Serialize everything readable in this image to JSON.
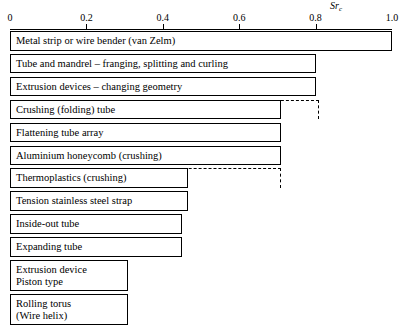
{
  "chart_data": {
    "type": "bar",
    "orientation": "horizontal",
    "title": "",
    "subtitle": "",
    "xlabel": "Sr_c",
    "xlabel_base": "Sr",
    "xlabel_sub": "c",
    "ylabel": "",
    "xlim": [
      0,
      1.0
    ],
    "grid": false,
    "legend": "none",
    "tick_labels": [
      "0",
      "0.2",
      "0.4",
      "0.6",
      "0.8",
      "1.0"
    ],
    "tick_values": [
      0,
      0.2,
      0.4,
      0.6,
      0.8,
      1.0
    ],
    "categories": [
      "Metal strip or wire bender (van Zelm)",
      "Tube and mandrel – franging, splitting and curling",
      "Extrusion devices – changing geometry",
      "Crushing (folding) tube",
      "Flattening tube array",
      "Aluminium honeycomb (crushing)",
      "Thermoplastics (crushing)",
      "Tension stainless steel strap",
      "Inside-out tube",
      "Expanding tube",
      "Extrusion device Piston type",
      "Rolling torus (Wire helix)"
    ],
    "values": [
      1.0,
      0.8,
      0.8,
      0.71,
      0.71,
      0.71,
      0.466,
      0.466,
      0.45,
      0.45,
      0.31,
      0.31
    ],
    "dashed_extension_values": [
      null,
      null,
      null,
      0.81,
      null,
      null,
      0.71,
      null,
      null,
      null,
      null,
      null
    ],
    "bars": [
      {
        "label": "Metal strip or wire bender (van Zelm)",
        "label_line1": "Metal strip or wire bender (van Zelm)",
        "label_line2": "",
        "value": 1.0,
        "dashed_to": null,
        "lines": 1
      },
      {
        "label": "Tube and mandrel – franging, splitting and curling",
        "label_line1": "Tube and mandrel – franging, splitting and curling",
        "label_line2": "",
        "value": 0.8,
        "dashed_to": null,
        "lines": 1
      },
      {
        "label": "Extrusion devices – changing geometry",
        "label_line1": "Extrusion devices – changing geometry",
        "label_line2": "",
        "value": 0.8,
        "dashed_to": null,
        "lines": 1
      },
      {
        "label": "Crushing (folding) tube",
        "label_line1": "Crushing (folding) tube",
        "label_line2": "",
        "value": 0.71,
        "dashed_to": 0.81,
        "lines": 1
      },
      {
        "label": "Flattening tube array",
        "label_line1": "Flattening tube array",
        "label_line2": "",
        "value": 0.71,
        "dashed_to": null,
        "lines": 1
      },
      {
        "label": "Aluminium honeycomb (crushing)",
        "label_line1": "Aluminium honeycomb (crushing)",
        "label_line2": "",
        "value": 0.71,
        "dashed_to": null,
        "lines": 1
      },
      {
        "label": "Thermoplastics (crushing)",
        "label_line1": "Thermoplastics (crushing)",
        "label_line2": "",
        "value": 0.466,
        "dashed_to": 0.71,
        "lines": 1
      },
      {
        "label": "Tension stainless steel strap",
        "label_line1": "Tension stainless steel strap",
        "label_line2": "",
        "value": 0.466,
        "dashed_to": null,
        "lines": 1
      },
      {
        "label": "Inside-out tube",
        "label_line1": "Inside-out tube",
        "label_line2": "",
        "value": 0.45,
        "dashed_to": null,
        "lines": 1
      },
      {
        "label": "Expanding tube",
        "label_line1": "Expanding tube",
        "label_line2": "",
        "value": 0.45,
        "dashed_to": null,
        "lines": 1
      },
      {
        "label": "Extrusion device Piston type",
        "label_line1": "Extrusion device",
        "label_line2": "Piston type",
        "value": 0.31,
        "dashed_to": null,
        "lines": 2
      },
      {
        "label": "Rolling torus (Wire helix)",
        "label_line1": "Rolling torus",
        "label_line2": "(Wire helix)",
        "value": 0.31,
        "dashed_to": null,
        "lines": 2
      }
    ],
    "colors": {
      "bar_fill": "#ffffff",
      "bar_stroke": "#000000",
      "axis": "#000000",
      "text": "#000000",
      "background": "#ffffff"
    }
  }
}
